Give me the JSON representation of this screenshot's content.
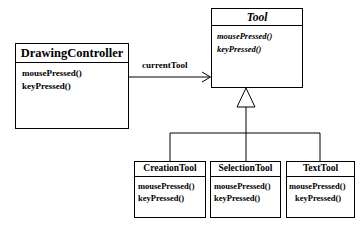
{
  "diagram": {
    "type": "uml-class-diagram",
    "background_color": "#ffffff",
    "line_color": "#000000"
  },
  "classes": {
    "tool": {
      "name": "Tool",
      "abstract": true,
      "operations": [
        "mousePressed()",
        "keyPressed()"
      ]
    },
    "drawing_controller": {
      "name": "DrawingController",
      "abstract": false,
      "operations": [
        "mousePressed()",
        "keyPressed()"
      ]
    },
    "creation_tool": {
      "name": "CreationTool",
      "abstract": false,
      "operations": [
        "mousePressed()",
        "keyPressed()"
      ]
    },
    "selection_tool": {
      "name": "SelectionTool",
      "abstract": false,
      "operations": [
        "mousePressed()",
        "keyPressed()"
      ]
    },
    "text_tool": {
      "name": "TextTool",
      "abstract": false,
      "operations": [
        "mousePressed()",
        "keyPressed()"
      ]
    }
  },
  "relationships": {
    "association": {
      "label": "currentTool",
      "from": "DrawingController",
      "to": "Tool",
      "arrow": "open"
    },
    "generalization": {
      "parent": "Tool",
      "children": [
        "CreationTool",
        "SelectionTool",
        "TextTool"
      ],
      "arrow": "hollow-triangle"
    }
  }
}
